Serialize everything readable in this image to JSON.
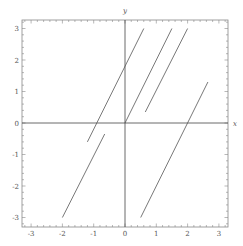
{
  "chart_data": {
    "type": "line",
    "title": "",
    "xlabel": "x",
    "ylabel": "y",
    "xlim": [
      -3.3,
      3.3
    ],
    "ylim": [
      -3.3,
      3.3
    ],
    "grid": false,
    "frame": true,
    "x_ticks": [
      -3,
      -2,
      -1,
      0,
      1,
      2,
      3
    ],
    "y_ticks": [
      -3,
      -2,
      -1,
      0,
      1,
      2,
      3
    ],
    "x_tick_labels": [
      "-3",
      "-2",
      "-1",
      "0",
      "1",
      "2",
      "3"
    ],
    "y_tick_labels": [
      "-3",
      "-2",
      "-1",
      "0",
      "1",
      "2",
      "3"
    ],
    "minor_ticks_per_unit": 5,
    "line_color": "#555555",
    "axis_color": "#444444",
    "frame_color": "#888888",
    "series": [
      {
        "name": "segment-1",
        "x": [
          -1.2,
          0.6
        ],
        "y": [
          -0.6,
          3.0
        ]
      },
      {
        "name": "segment-2",
        "x": [
          0.0,
          1.5
        ],
        "y": [
          0.0,
          3.0
        ]
      },
      {
        "name": "segment-3",
        "x": [
          0.65,
          2.0
        ],
        "y": [
          0.35,
          3.0
        ]
      },
      {
        "name": "segment-4",
        "x": [
          -2.0,
          -0.65
        ],
        "y": [
          -3.0,
          -0.35
        ]
      },
      {
        "name": "segment-5",
        "x": [
          0.5,
          2.65
        ],
        "y": [
          -3.0,
          1.3
        ]
      }
    ]
  }
}
